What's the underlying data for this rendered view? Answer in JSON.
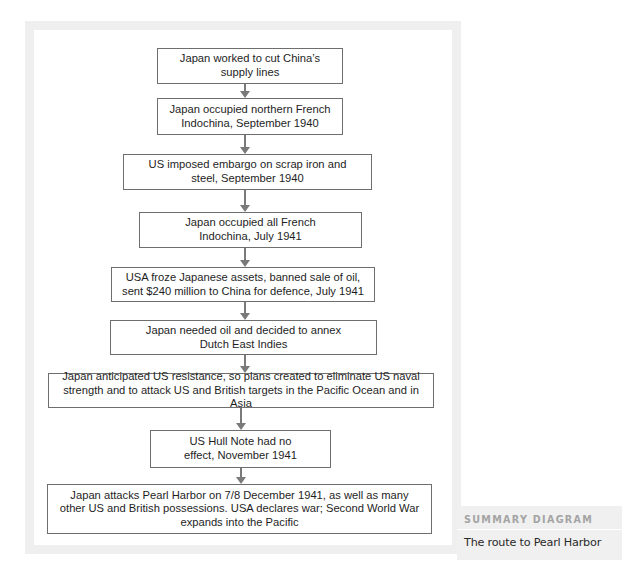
{
  "diagram": {
    "boxes": [
      {
        "id": 1,
        "text": "Japan worked to cut China’s supply lines"
      },
      {
        "id": 2,
        "text": "Japan occupied northern French Indochina, September 1940"
      },
      {
        "id": 3,
        "text": "US imposed embargo on scrap iron and steel, September 1940"
      },
      {
        "id": 4,
        "text": "Japan occupied all French Indochina, July 1941"
      },
      {
        "id": 5,
        "text": "USA froze Japanese assets, banned sale of oil, sent $240 million to China for defence, July 1941"
      },
      {
        "id": 6,
        "text": "Japan needed oil and decided to annex Dutch East Indies"
      },
      {
        "id": 7,
        "text": "Japan anticipated US resistance, so plans created to eliminate US naval strength and to attack US and British targets in the Pacific Ocean and in Asia"
      },
      {
        "id": 8,
        "text": "US Hull Note had no effect, November 1941"
      },
      {
        "id": 9,
        "text": "Japan attacks Pearl Harbor on 7/8 December 1941, as well as many other US and British possessions. USA declares war; Second World War expands into the Pacific"
      }
    ],
    "edges": [
      [
        1,
        2
      ],
      [
        2,
        3
      ],
      [
        3,
        4
      ],
      [
        4,
        5
      ],
      [
        5,
        6
      ],
      [
        6,
        7
      ],
      [
        7,
        8
      ],
      [
        8,
        9
      ]
    ],
    "colors": {
      "box_border": "#6e6e6e",
      "arrow": "#7a7a7a",
      "panel": "#efefef",
      "label_head": "#a4a4a4"
    }
  },
  "label": {
    "heading": "SUMMARY DIAGRAM",
    "caption": "The route to Pearl Harbor"
  }
}
